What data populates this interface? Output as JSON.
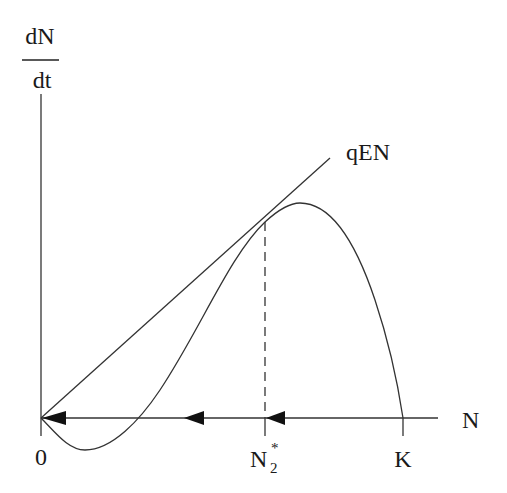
{
  "diagram": {
    "y_label_numerator": "dN",
    "y_label_denominator": "dt",
    "x_axis_label": "N",
    "line_label": "qEN",
    "tick_labels": {
      "origin": "0",
      "equilibrium_main": "N",
      "equilibrium_sub": "2",
      "equilibrium_sup": "*",
      "carrying_capacity": "K"
    },
    "colors": {
      "stroke": "#333333",
      "arrow": "#111111",
      "background": "#ffffff"
    },
    "arrows": [
      {
        "position": "near origin",
        "direction": "left"
      },
      {
        "position": "between curve crossing and N2*",
        "direction": "left"
      },
      {
        "position": "between N2* and K",
        "direction": "left"
      }
    ]
  }
}
